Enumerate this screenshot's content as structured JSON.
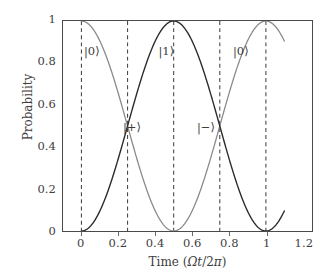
{
  "chart_data": {
    "type": "line",
    "title": "",
    "xlabel": "Time (Ωt/2π)",
    "ylabel": "Probability",
    "xlim": [
      -0.1,
      1.25
    ],
    "ylim": [
      0,
      1
    ],
    "grid": false,
    "legend": "none",
    "xticks": [
      "0",
      "0.2",
      "0.4",
      "0.6",
      "0.8",
      "1",
      "1.2"
    ],
    "xtick_values": [
      0,
      0.2,
      0.4,
      0.6,
      0.8,
      1,
      1.2
    ],
    "yticks": [
      "0",
      "0.2",
      "0.4",
      "0.6",
      "0.8",
      "1"
    ],
    "ytick_values": [
      0,
      0.2,
      0.4,
      0.6,
      0.8,
      1
    ],
    "series": [
      {
        "name": "P0",
        "color": "#8a8a8a",
        "formula": "cos^2(pi*x)",
        "x": [
          0,
          0.05,
          0.1,
          0.15,
          0.2,
          0.25,
          0.3,
          0.35,
          0.4,
          0.45,
          0.5,
          0.55,
          0.6,
          0.65,
          0.7,
          0.75,
          0.8,
          0.85,
          0.9,
          0.95,
          1.0,
          1.05,
          1.1
        ],
        "values": [
          1.0,
          0.976,
          0.905,
          0.794,
          0.655,
          0.5,
          0.345,
          0.206,
          0.095,
          0.024,
          0.0,
          0.024,
          0.095,
          0.206,
          0.345,
          0.5,
          0.655,
          0.794,
          0.905,
          0.976,
          1.0,
          0.976,
          0.905
        ]
      },
      {
        "name": "P1",
        "color": "#2b2b2b",
        "formula": "sin^2(pi*x)",
        "x": [
          0,
          0.05,
          0.1,
          0.15,
          0.2,
          0.25,
          0.3,
          0.35,
          0.4,
          0.45,
          0.5,
          0.55,
          0.6,
          0.65,
          0.7,
          0.75,
          0.8,
          0.85,
          0.9,
          0.95,
          1.0,
          1.05,
          1.1
        ],
        "values": [
          0.0,
          0.024,
          0.095,
          0.206,
          0.345,
          0.5,
          0.655,
          0.794,
          0.905,
          0.976,
          1.0,
          0.976,
          0.905,
          0.794,
          0.655,
          0.5,
          0.345,
          0.206,
          0.095,
          0.024,
          0.0,
          0.024,
          0.095
        ]
      }
    ],
    "vlines": [
      {
        "x": 0,
        "style": "dashed",
        "color": "#4a4a4a"
      },
      {
        "x": 0.25,
        "style": "dashed",
        "color": "#4a4a4a"
      },
      {
        "x": 0.5,
        "style": "dashed",
        "color": "#4a4a4a"
      },
      {
        "x": 0.75,
        "style": "dashed",
        "color": "#4a4a4a"
      },
      {
        "x": 1.0,
        "style": "dashed",
        "color": "#4a4a4a"
      }
    ],
    "annotations": [
      {
        "text": "|0⟩",
        "x": 0.0,
        "y": 0.93
      },
      {
        "text": "|1⟩",
        "x": 0.5,
        "y": 0.93
      },
      {
        "text": "|0⟩",
        "x": 1.0,
        "y": 0.93
      },
      {
        "text": "|+⟩",
        "x": 0.25,
        "y": 0.5
      },
      {
        "text": "|−⟩",
        "x": 0.75,
        "y": 0.5
      }
    ]
  },
  "axis": {
    "ylabel": "Probability",
    "xlabel_prefix": "Time (",
    "xlabel_omega": "Ω",
    "xlabel_t": "t",
    "xlabel_slash": "/2",
    "xlabel_pi": "π",
    "xlabel_suffix": ")",
    "yticks": {
      "t0": "0",
      "t1": "0.2",
      "t2": "0.4",
      "t3": "0.6",
      "t4": "0.8",
      "t5": "1"
    },
    "xticks": {
      "t0": "0",
      "t1": "0.2",
      "t2": "0.4",
      "t3": "0.6",
      "t4": "0.8",
      "t5": "1",
      "t6": "1.2"
    }
  },
  "annotations": {
    "ket0_first": "|0⟩",
    "ket1": "|1⟩",
    "ket0_second": "|0⟩",
    "ketplus": "|+⟩",
    "ketminus": "|−⟩"
  },
  "colors": {
    "curve_p0": "#8a8a8a",
    "curve_p1": "#2b2b2b",
    "axis": "#4a4a4a",
    "text": "#3d3d3d",
    "background": "#ffffff"
  }
}
